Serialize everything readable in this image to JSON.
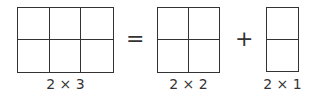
{
  "equation": {
    "left": {
      "rows": 2,
      "cols": 3,
      "label": "2 × 3"
    },
    "equals": "=",
    "middle": {
      "rows": 2,
      "cols": 2,
      "label": "2 × 2"
    },
    "plus": "+",
    "right": {
      "rows": 2,
      "cols": 1,
      "label": "2 × 1"
    }
  },
  "colors": {
    "stroke": "#333333",
    "background": "#ffffff"
  }
}
